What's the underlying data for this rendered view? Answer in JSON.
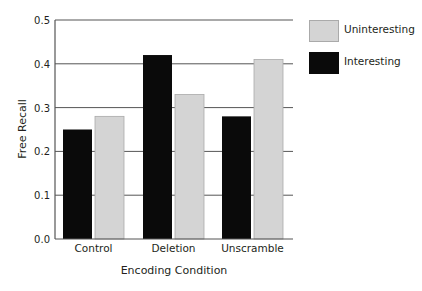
{
  "chart_data": {
    "type": "bar",
    "title": "",
    "xlabel": "Encoding Condition",
    "ylabel": "Free Recall",
    "categories": [
      "Control",
      "Deletion",
      "Unscramble"
    ],
    "series": [
      {
        "name": "Interesting",
        "color": "#0a0a0a",
        "values": [
          0.25,
          0.42,
          0.28
        ]
      },
      {
        "name": "Uninteresting",
        "color": "#d4d4d4",
        "values": [
          0.28,
          0.33,
          0.41
        ]
      }
    ],
    "ylim": [
      0,
      0.5
    ],
    "yticks": [
      "0.0",
      "0.1",
      "0.2",
      "0.3",
      "0.4",
      "0.5"
    ],
    "grid": true,
    "legend": {
      "position": "right-top",
      "entries": [
        {
          "label": "Uninteresting",
          "color": "#d4d4d4"
        },
        {
          "label": "Interesting",
          "color": "#0a0a0a"
        }
      ]
    }
  }
}
